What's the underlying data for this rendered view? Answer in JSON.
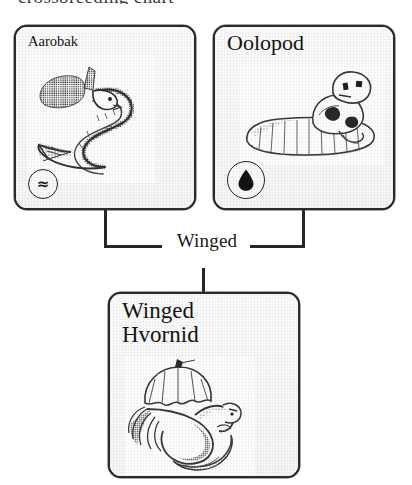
{
  "page": {
    "top_cut_text": "crossbreeding chart",
    "background_color": "#ffffff",
    "ink_color": "#262626"
  },
  "breeding_diagram": {
    "type": "crossbreed",
    "trait_label": "Winged",
    "parents": [
      {
        "id": "aarobak",
        "name": "Aarobak",
        "element_badge": {
          "icon": "water-wave-icon",
          "glyph": "≈",
          "filled": false
        },
        "artwork": "serpentine eel creature with crest and finned tail"
      },
      {
        "id": "oolopod",
        "name": "Oolopod",
        "element_badge": {
          "icon": "water-droplet-icon",
          "glyph": "droplet",
          "filled": true
        },
        "artwork": "segmented slug-like creature with raised head"
      }
    ],
    "offspring": {
      "id": "winged-hvornid",
      "name": "Winged\nHvornid",
      "name_plain": "Winged Hvornid",
      "element_badge": null,
      "artwork": "winged tentacled creature with membranous wings"
    },
    "connectors": [
      {
        "from": "aarobak",
        "to": "trait-label"
      },
      {
        "from": "oolopod",
        "to": "trait-label"
      },
      {
        "from": "trait-label",
        "to": "winged-hvornid"
      }
    ]
  }
}
